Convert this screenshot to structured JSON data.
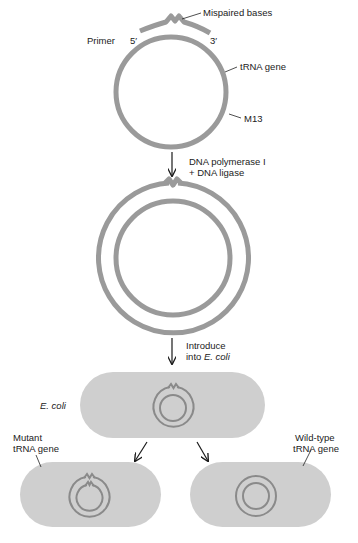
{
  "colors": {
    "dna_strand": "#9a9a9a",
    "cell_fill": "#cfcfcf",
    "plasmid_in_cell": "#8a8a8a",
    "arrow": "#1a1a1a",
    "text": "#222222"
  },
  "labels": {
    "mispaired_bases": "Mispaired bases",
    "primer": "Primer",
    "five_prime": "5′",
    "three_prime": "3′",
    "trna_gene": "tRNA gene",
    "m13": "M13",
    "step1_line1": "DNA polymerase I",
    "step1_line2": "+ DNA ligase",
    "step2_line1": "Introduce",
    "step2_line2_prefix": "into ",
    "step2_line2_italic": "E. coli",
    "ecoli": "E. coli",
    "mutant_line1": "Mutant",
    "mutant_line2": "tRNA gene",
    "wildtype_line1": "Wild-type",
    "wildtype_line2": "tRNA gene"
  }
}
